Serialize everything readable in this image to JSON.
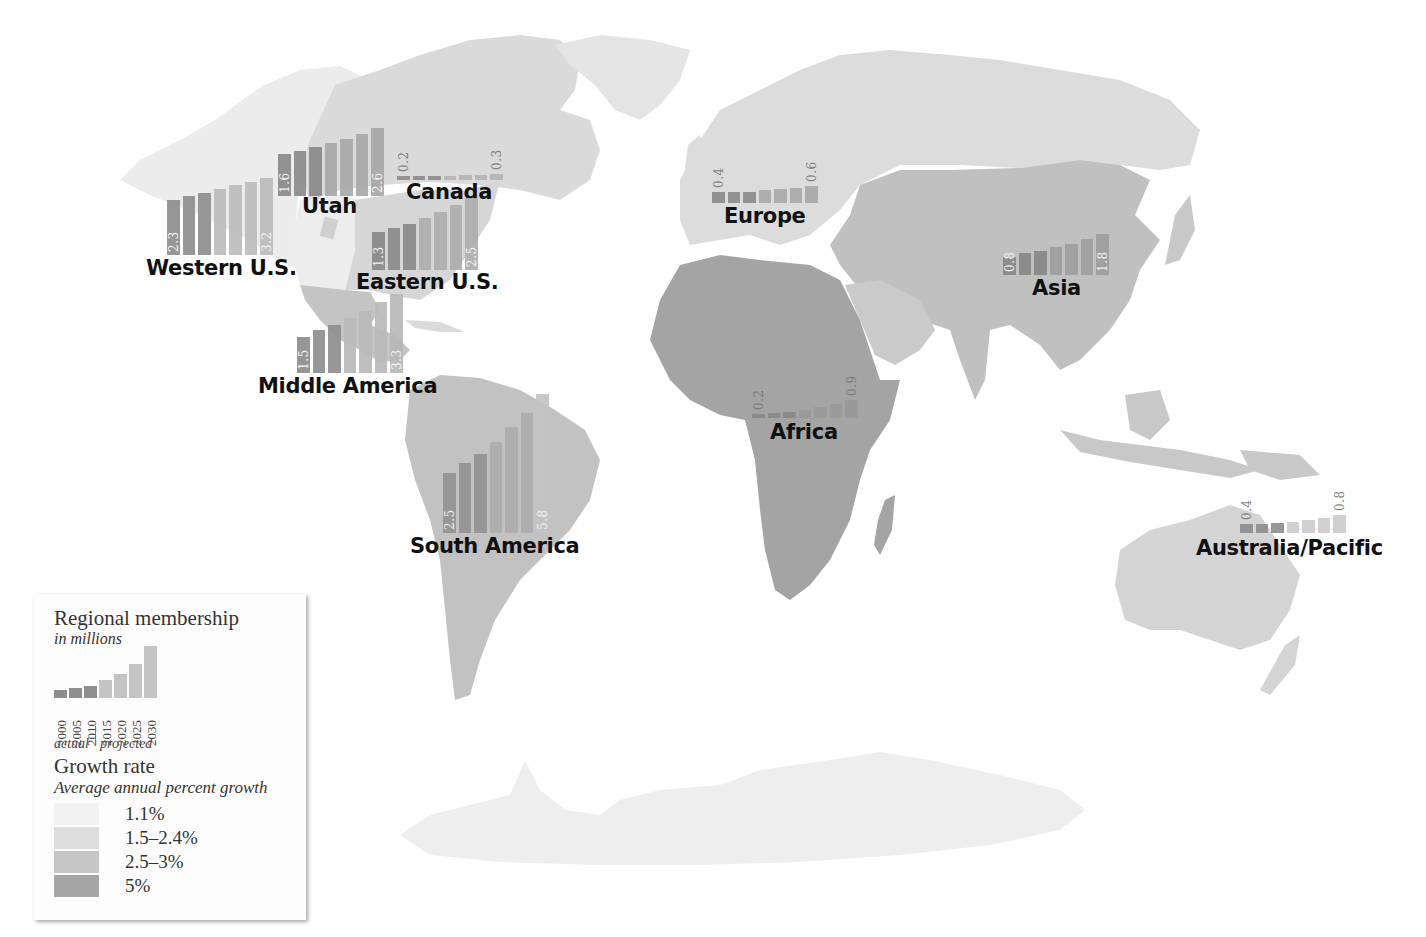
{
  "map": {
    "background": "#ffffff",
    "fills": {
      "very_light": "#ececec",
      "light": "#dadada",
      "medium": "#c3c3c3",
      "dark": "#a3a3a3",
      "antarctica": "#ededed"
    }
  },
  "legend": {
    "title": "Regional membership",
    "subtitle": "in millions",
    "years": [
      "2000",
      "2005",
      "2010",
      "2015",
      "2020",
      "2025",
      "2030"
    ],
    "actual_label": "actual",
    "projected_label": "projected",
    "sample_heights": [
      8,
      10,
      12,
      18,
      24,
      34,
      52
    ],
    "growth_title": "Growth rate",
    "growth_subtitle": "Average annual percent growth",
    "growth_classes": [
      {
        "label": "1.1%",
        "color": "#f2f2f2"
      },
      {
        "label": "1.5–2.4%",
        "color": "#dedede"
      },
      {
        "label": "2.5–3%",
        "color": "#c6c6c6"
      },
      {
        "label": "5%",
        "color": "#a6a6a6"
      }
    ]
  },
  "chart_data": {
    "type": "bar",
    "title": "Regional membership in millions",
    "categories": [
      "2000",
      "2005",
      "2010",
      "2015",
      "2020",
      "2025",
      "2030"
    ],
    "x_note": "2000–2010 actual, 2015–2030 projected",
    "ylabel": "Membership (millions)",
    "series": [
      {
        "name": "Western U.S.",
        "values": [
          2.3,
          2.45,
          2.6,
          2.75,
          2.9,
          3.05,
          3.2
        ],
        "labeled": [
          2.3,
          3.2
        ]
      },
      {
        "name": "Utah",
        "values": [
          1.6,
          1.75,
          1.9,
          2.05,
          2.2,
          2.4,
          2.6
        ],
        "labeled": [
          1.6,
          2.6
        ]
      },
      {
        "name": "Canada",
        "values": [
          0.2,
          0.2,
          0.2,
          0.22,
          0.25,
          0.27,
          0.3
        ],
        "labeled": [
          0.2,
          0.3
        ]
      },
      {
        "name": "Eastern U.S.",
        "values": [
          1.3,
          1.45,
          1.6,
          1.8,
          2.0,
          2.25,
          2.5
        ],
        "labeled": [
          1.3,
          2.5
        ]
      },
      {
        "name": "Middle America",
        "values": [
          1.5,
          1.8,
          2.0,
          2.3,
          2.6,
          2.95,
          3.3
        ],
        "labeled": [
          1.5,
          3.3
        ]
      },
      {
        "name": "South America",
        "values": [
          2.5,
          2.9,
          3.3,
          3.8,
          4.4,
          5.0,
          5.8
        ],
        "labeled": [
          2.5,
          5.8
        ]
      },
      {
        "name": "Europe",
        "values": [
          0.4,
          0.4,
          0.4,
          0.45,
          0.5,
          0.55,
          0.6
        ],
        "labeled": [
          0.4,
          0.6
        ]
      },
      {
        "name": "Asia",
        "values": [
          0.8,
          0.95,
          1.05,
          1.2,
          1.35,
          1.55,
          1.8
        ],
        "labeled": [
          0.8,
          1.8
        ]
      },
      {
        "name": "Africa",
        "values": [
          0.2,
          0.25,
          0.32,
          0.42,
          0.55,
          0.7,
          0.9
        ],
        "labeled": [
          0.2,
          0.9
        ]
      },
      {
        "name": "Australia/Pacific",
        "values": [
          0.4,
          0.42,
          0.45,
          0.5,
          0.58,
          0.68,
          0.8
        ],
        "labeled": [
          0.4,
          0.8
        ]
      }
    ]
  },
  "regions": [
    {
      "name": "Western U.S.",
      "left": 167,
      "bottom": 255,
      "scale": 24,
      "colors": [
        "#8e8e8e",
        "#8e8e8e",
        "#8e8e8e",
        "#bcbcbc",
        "#bcbcbc",
        "#bcbcbc",
        "#bcbcbc"
      ],
      "first": "2.3",
      "last": "3.2",
      "label_x": 146,
      "label_y": 256
    },
    {
      "name": "Utah",
      "left": 278,
      "bottom": 196,
      "scale": 26,
      "colors": [
        "#8a8a8a",
        "#8a8a8a",
        "#8a8a8a",
        "#a8a8a8",
        "#a8a8a8",
        "#a8a8a8",
        "#a8a8a8"
      ],
      "first": "1.6",
      "last": "2.6",
      "label_x": 302,
      "label_y": 194
    },
    {
      "name": "Canada",
      "left": 397,
      "bottom": 180,
      "scale": 20,
      "colors": [
        "#8e8e8e",
        "#8e8e8e",
        "#8e8e8e",
        "#b4b4b4",
        "#b4b4b4",
        "#b4b4b4",
        "#b4b4b4"
      ],
      "first": "0.2",
      "last": "0.3",
      "label_x": 406,
      "label_y": 180,
      "dark_values": true
    },
    {
      "name": "Eastern U.S.",
      "left": 372,
      "bottom": 270,
      "scale": 29,
      "colors": [
        "#8a8a8a",
        "#8a8a8a",
        "#8a8a8a",
        "#aeaeae",
        "#aeaeae",
        "#aeaeae",
        "#aeaeae"
      ],
      "first": "1.3",
      "last": "2.5",
      "label_x": 356,
      "label_y": 270
    },
    {
      "name": "Middle America",
      "left": 297,
      "bottom": 373,
      "scale": 24,
      "colors": [
        "#8e8e8e",
        "#8e8e8e",
        "#8e8e8e",
        "#b8b8b8",
        "#b8b8b8",
        "#b8b8b8",
        "#b8b8b8"
      ],
      "first": "1.5",
      "last": "3.3",
      "label_x": 258,
      "label_y": 374
    },
    {
      "name": "South America",
      "left": 443,
      "bottom": 533,
      "scale": 24,
      "colors": [
        "#939393",
        "#939393",
        "#939393",
        "#acacac",
        "#acacac",
        "#acacac",
        "#c4c4c4"
      ],
      "first": "2.5",
      "last": "5.8",
      "label_x": 410,
      "label_y": 534
    },
    {
      "name": "Europe",
      "left": 712,
      "bottom": 203,
      "scale": 28,
      "colors": [
        "#8a8a8a",
        "#8a8a8a",
        "#8a8a8a",
        "#a8a8a8",
        "#a8a8a8",
        "#a8a8a8",
        "#a8a8a8"
      ],
      "first": "0.4",
      "last": "0.6",
      "label_x": 724,
      "label_y": 204,
      "dark_values": true
    },
    {
      "name": "Asia",
      "left": 1003,
      "bottom": 275,
      "scale": 23,
      "colors": [
        "#888888",
        "#888888",
        "#888888",
        "#9e9e9e",
        "#9e9e9e",
        "#9e9e9e",
        "#9e9e9e"
      ],
      "first": "0.8",
      "last": "1.8",
      "label_x": 1032,
      "label_y": 276
    },
    {
      "name": "Africa",
      "left": 752,
      "bottom": 418,
      "scale": 20,
      "colors": [
        "#888888",
        "#888888",
        "#888888",
        "#999999",
        "#999999",
        "#999999",
        "#999999"
      ],
      "first": "0.2",
      "last": "0.9",
      "label_x": 770,
      "label_y": 420,
      "dark_values": true
    },
    {
      "name": "Australia/Pacific",
      "left": 1240,
      "bottom": 533,
      "scale": 22,
      "colors": [
        "#8e8e8e",
        "#8e8e8e",
        "#8e8e8e",
        "#cdcdcd",
        "#cdcdcd",
        "#cdcdcd",
        "#cdcdcd"
      ],
      "first": "0.4",
      "last": "0.8",
      "label_x": 1196,
      "label_y": 536,
      "dark_values": true
    }
  ]
}
